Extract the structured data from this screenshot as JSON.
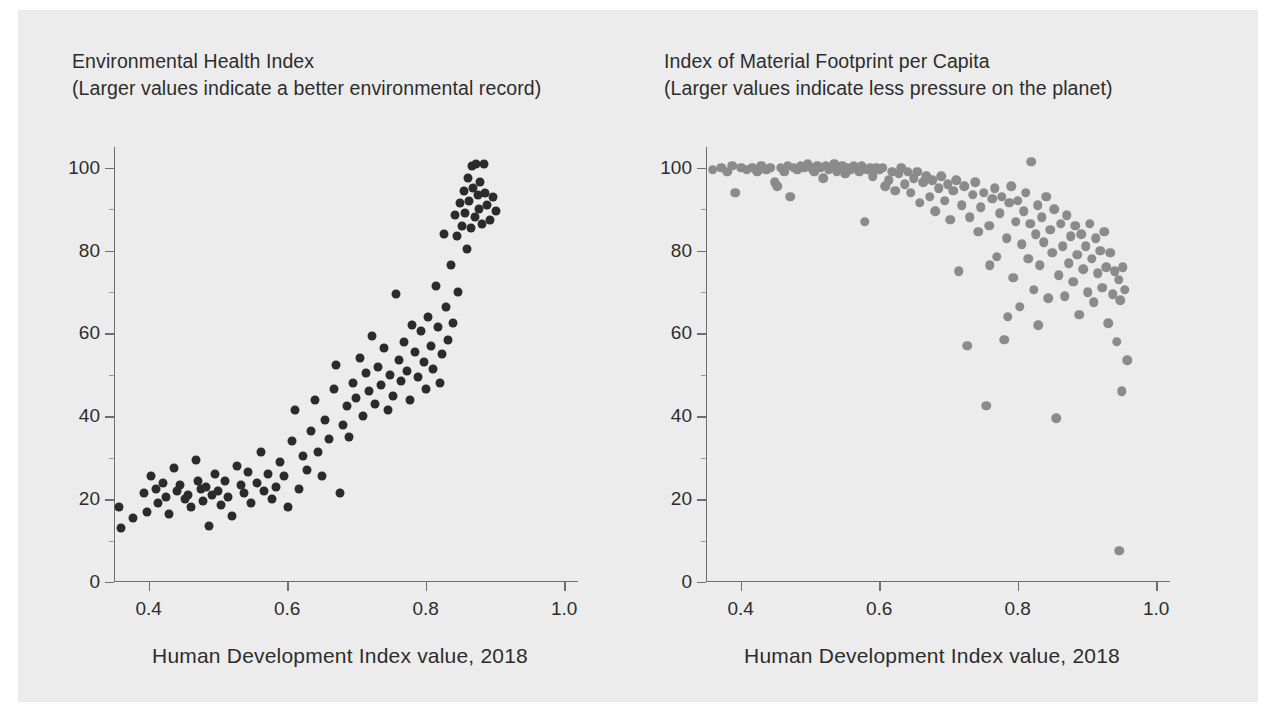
{
  "figure": {
    "background": "#ececec",
    "page_background": "#ffffff"
  },
  "panels": {
    "left": {
      "title_line1": "Environmental Health Index",
      "title_line2": "(Larger values indicate a better environmental record)",
      "axis_caption": "Human Development Index value, 2018",
      "dot_color": "#2b2b2b"
    },
    "right": {
      "title_line1": "Index of Material Footprint per Capita",
      "title_line2": "(Larger values indicate less pressure on the planet)",
      "axis_caption": "Human Development Index value, 2018",
      "dot_color": "#8b8b8b"
    }
  },
  "chart_data": [
    {
      "type": "scatter",
      "title": "Environmental Health Index",
      "subtitle": "(Larger values indicate a better environmental record)",
      "xlabel": "Human Development Index value, 2018",
      "ylabel": "Environmental Health Index",
      "xlim": [
        0.35,
        1.02
      ],
      "ylim": [
        0,
        105
      ],
      "xticks": [
        0.4,
        0.6,
        0.8,
        1.0
      ],
      "xtick_labels": [
        "0.4",
        "0.6",
        "0.8",
        "1.0"
      ],
      "yticks": [
        0,
        20,
        40,
        60,
        80,
        100
      ],
      "ytick_labels": [
        "0",
        "20",
        "40",
        "60",
        "80",
        "100"
      ],
      "grid": false,
      "legend": false,
      "marker_color": "#2b2b2b",
      "points": [
        [
          0.357,
          18.0
        ],
        [
          0.36,
          13.0
        ],
        [
          0.378,
          15.5
        ],
        [
          0.394,
          21.5
        ],
        [
          0.397,
          17.0
        ],
        [
          0.404,
          25.5
        ],
        [
          0.41,
          22.5
        ],
        [
          0.414,
          19.0
        ],
        [
          0.421,
          24.0
        ],
        [
          0.425,
          20.5
        ],
        [
          0.43,
          16.5
        ],
        [
          0.437,
          27.5
        ],
        [
          0.441,
          22.0
        ],
        [
          0.446,
          23.5
        ],
        [
          0.452,
          20.0
        ],
        [
          0.457,
          21.0
        ],
        [
          0.461,
          18.0
        ],
        [
          0.468,
          29.5
        ],
        [
          0.472,
          24.5
        ],
        [
          0.476,
          22.5
        ],
        [
          0.479,
          19.5
        ],
        [
          0.483,
          23.0
        ],
        [
          0.487,
          13.5
        ],
        [
          0.492,
          21.0
        ],
        [
          0.496,
          26.0
        ],
        [
          0.5,
          22.0
        ],
        [
          0.505,
          18.5
        ],
        [
          0.511,
          24.5
        ],
        [
          0.515,
          20.5
        ],
        [
          0.52,
          16.0
        ],
        [
          0.527,
          28.0
        ],
        [
          0.533,
          23.5
        ],
        [
          0.538,
          21.5
        ],
        [
          0.543,
          26.5
        ],
        [
          0.548,
          19.0
        ],
        [
          0.556,
          24.0
        ],
        [
          0.562,
          31.5
        ],
        [
          0.567,
          22.0
        ],
        [
          0.572,
          26.0
        ],
        [
          0.578,
          20.0
        ],
        [
          0.584,
          23.0
        ],
        [
          0.59,
          29.0
        ],
        [
          0.596,
          25.5
        ],
        [
          0.601,
          18.0
        ],
        [
          0.607,
          34.0
        ],
        [
          0.612,
          41.5
        ],
        [
          0.617,
          22.5
        ],
        [
          0.623,
          30.5
        ],
        [
          0.628,
          27.0
        ],
        [
          0.634,
          36.5
        ],
        [
          0.64,
          44.0
        ],
        [
          0.645,
          31.5
        ],
        [
          0.65,
          25.5
        ],
        [
          0.655,
          39.0
        ],
        [
          0.661,
          34.5
        ],
        [
          0.667,
          46.5
        ],
        [
          0.671,
          52.5
        ],
        [
          0.676,
          21.5
        ],
        [
          0.681,
          38.0
        ],
        [
          0.686,
          42.5
        ],
        [
          0.69,
          35.0
        ],
        [
          0.695,
          48.0
        ],
        [
          0.7,
          44.5
        ],
        [
          0.705,
          54.0
        ],
        [
          0.709,
          40.0
        ],
        [
          0.714,
          50.5
        ],
        [
          0.718,
          46.0
        ],
        [
          0.723,
          59.5
        ],
        [
          0.727,
          43.0
        ],
        [
          0.731,
          52.0
        ],
        [
          0.736,
          47.5
        ],
        [
          0.74,
          56.5
        ],
        [
          0.745,
          41.5
        ],
        [
          0.749,
          50.0
        ],
        [
          0.753,
          45.0
        ],
        [
          0.757,
          69.5
        ],
        [
          0.761,
          53.5
        ],
        [
          0.765,
          48.5
        ],
        [
          0.769,
          58.0
        ],
        [
          0.773,
          51.0
        ],
        [
          0.777,
          44.0
        ],
        [
          0.781,
          62.0
        ],
        [
          0.785,
          55.5
        ],
        [
          0.789,
          49.5
        ],
        [
          0.793,
          60.5
        ],
        [
          0.797,
          53.0
        ],
        [
          0.8,
          46.5
        ],
        [
          0.804,
          64.0
        ],
        [
          0.808,
          57.0
        ],
        [
          0.811,
          51.5
        ],
        [
          0.815,
          71.5
        ],
        [
          0.818,
          61.5
        ],
        [
          0.821,
          48.0
        ],
        [
          0.824,
          55.0
        ],
        [
          0.827,
          84.0
        ],
        [
          0.83,
          66.5
        ],
        [
          0.833,
          58.5
        ],
        [
          0.836,
          76.5
        ],
        [
          0.839,
          62.5
        ],
        [
          0.842,
          88.5
        ],
        [
          0.845,
          83.5
        ],
        [
          0.847,
          70.0
        ],
        [
          0.85,
          91.5
        ],
        [
          0.852,
          86.0
        ],
        [
          0.855,
          94.5
        ],
        [
          0.857,
          89.0
        ],
        [
          0.859,
          80.5
        ],
        [
          0.861,
          97.5
        ],
        [
          0.863,
          92.0
        ],
        [
          0.865,
          85.5
        ],
        [
          0.867,
          100.5
        ],
        [
          0.869,
          95.0
        ],
        [
          0.871,
          88.0
        ],
        [
          0.873,
          101.0
        ],
        [
          0.875,
          93.5
        ],
        [
          0.877,
          90.0
        ],
        [
          0.879,
          96.5
        ],
        [
          0.881,
          86.5
        ],
        [
          0.884,
          101.0
        ],
        [
          0.886,
          94.0
        ],
        [
          0.889,
          91.0
        ],
        [
          0.893,
          87.5
        ],
        [
          0.897,
          93.0
        ],
        [
          0.902,
          89.5
        ]
      ]
    },
    {
      "type": "scatter",
      "title": "Index of Material Footprint per Capita",
      "subtitle": "(Larger values indicate less pressure on the planet)",
      "xlabel": "Human Development Index value, 2018",
      "ylabel": "Index of Material Footprint per Capita",
      "xlim": [
        0.35,
        1.02
      ],
      "ylim": [
        0,
        105
      ],
      "xticks": [
        0.4,
        0.6,
        0.8,
        1.0
      ],
      "xtick_labels": [
        "0.4",
        "0.6",
        "0.8",
        "1.0"
      ],
      "yticks": [
        0,
        20,
        40,
        60,
        80,
        100
      ],
      "ytick_labels": [
        "0",
        "20",
        "40",
        "60",
        "80",
        "100"
      ],
      "grid": false,
      "legend": false,
      "marker_color": "#8b8b8b",
      "points": [
        [
          0.36,
          99.5
        ],
        [
          0.372,
          100.0
        ],
        [
          0.381,
          99.0
        ],
        [
          0.388,
          100.5
        ],
        [
          0.392,
          94.0
        ],
        [
          0.401,
          100.0
        ],
        [
          0.409,
          99.5
        ],
        [
          0.417,
          100.0
        ],
        [
          0.424,
          99.0
        ],
        [
          0.43,
          100.5
        ],
        [
          0.437,
          99.5
        ],
        [
          0.443,
          100.0
        ],
        [
          0.449,
          96.5
        ],
        [
          0.453,
          95.5
        ],
        [
          0.458,
          100.0
        ],
        [
          0.463,
          99.0
        ],
        [
          0.468,
          100.5
        ],
        [
          0.472,
          93.0
        ],
        [
          0.477,
          100.0
        ],
        [
          0.482,
          99.5
        ],
        [
          0.487,
          100.5
        ],
        [
          0.492,
          100.0
        ],
        [
          0.497,
          101.0
        ],
        [
          0.502,
          100.0
        ],
        [
          0.506,
          99.0
        ],
        [
          0.511,
          100.5
        ],
        [
          0.515,
          100.0
        ],
        [
          0.519,
          97.5
        ],
        [
          0.523,
          100.5
        ],
        [
          0.527,
          99.5
        ],
        [
          0.531,
          100.0
        ],
        [
          0.535,
          101.0
        ],
        [
          0.539,
          99.0
        ],
        [
          0.543,
          100.0
        ],
        [
          0.547,
          100.5
        ],
        [
          0.551,
          98.5
        ],
        [
          0.555,
          100.0
        ],
        [
          0.559,
          99.5
        ],
        [
          0.563,
          100.5
        ],
        [
          0.567,
          100.0
        ],
        [
          0.571,
          99.0
        ],
        [
          0.575,
          100.5
        ],
        [
          0.579,
          87.0
        ],
        [
          0.583,
          99.5
        ],
        [
          0.587,
          100.0
        ],
        [
          0.591,
          98.0
        ],
        [
          0.596,
          100.0
        ],
        [
          0.6,
          99.5
        ],
        [
          0.605,
          100.0
        ],
        [
          0.609,
          95.5
        ],
        [
          0.614,
          97.0
        ],
        [
          0.619,
          99.0
        ],
        [
          0.623,
          94.5
        ],
        [
          0.628,
          98.5
        ],
        [
          0.632,
          100.0
        ],
        [
          0.637,
          96.0
        ],
        [
          0.641,
          99.0
        ],
        [
          0.646,
          94.0
        ],
        [
          0.65,
          97.5
        ],
        [
          0.655,
          99.0
        ],
        [
          0.659,
          91.5
        ],
        [
          0.664,
          96.5
        ],
        [
          0.668,
          98.0
        ],
        [
          0.673,
          93.0
        ],
        [
          0.677,
          97.0
        ],
        [
          0.681,
          89.5
        ],
        [
          0.686,
          95.0
        ],
        [
          0.69,
          98.0
        ],
        [
          0.695,
          92.0
        ],
        [
          0.699,
          96.0
        ],
        [
          0.703,
          87.5
        ],
        [
          0.707,
          94.5
        ],
        [
          0.711,
          97.0
        ],
        [
          0.715,
          75.0
        ],
        [
          0.719,
          91.0
        ],
        [
          0.723,
          95.5
        ],
        [
          0.727,
          57.0
        ],
        [
          0.731,
          88.0
        ],
        [
          0.735,
          93.5
        ],
        [
          0.739,
          96.5
        ],
        [
          0.743,
          84.5
        ],
        [
          0.747,
          90.5
        ],
        [
          0.751,
          94.0
        ],
        [
          0.755,
          42.5
        ],
        [
          0.759,
          86.0
        ],
        [
          0.763,
          92.5
        ],
        [
          0.767,
          95.0
        ],
        [
          0.77,
          78.5
        ],
        [
          0.774,
          89.0
        ],
        [
          0.777,
          93.0
        ],
        [
          0.781,
          58.5
        ],
        [
          0.784,
          83.0
        ],
        [
          0.788,
          91.5
        ],
        [
          0.791,
          95.5
        ],
        [
          0.794,
          73.5
        ],
        [
          0.797,
          87.0
        ],
        [
          0.8,
          92.0
        ],
        [
          0.803,
          66.5
        ],
        [
          0.806,
          81.5
        ],
        [
          0.809,
          89.5
        ],
        [
          0.812,
          94.0
        ],
        [
          0.815,
          78.0
        ],
        [
          0.818,
          86.5
        ],
        [
          0.82,
          101.5
        ],
        [
          0.823,
          70.5
        ],
        [
          0.826,
          84.0
        ],
        [
          0.829,
          91.0
        ],
        [
          0.832,
          76.5
        ],
        [
          0.835,
          88.0
        ],
        [
          0.838,
          82.0
        ],
        [
          0.841,
          93.0
        ],
        [
          0.844,
          68.5
        ],
        [
          0.847,
          85.0
        ],
        [
          0.85,
          79.5
        ],
        [
          0.853,
          90.0
        ],
        [
          0.856,
          39.5
        ],
        [
          0.859,
          74.0
        ],
        [
          0.862,
          86.5
        ],
        [
          0.865,
          81.0
        ],
        [
          0.868,
          69.0
        ],
        [
          0.871,
          88.5
        ],
        [
          0.874,
          77.0
        ],
        [
          0.877,
          83.5
        ],
        [
          0.88,
          72.5
        ],
        [
          0.883,
          86.0
        ],
        [
          0.886,
          79.0
        ],
        [
          0.889,
          64.5
        ],
        [
          0.892,
          84.0
        ],
        [
          0.895,
          75.5
        ],
        [
          0.898,
          81.0
        ],
        [
          0.901,
          70.0
        ],
        [
          0.904,
          86.5
        ],
        [
          0.907,
          78.0
        ],
        [
          0.91,
          67.5
        ],
        [
          0.913,
          83.0
        ],
        [
          0.916,
          74.5
        ],
        [
          0.919,
          80.0
        ],
        [
          0.922,
          71.0
        ],
        [
          0.925,
          84.5
        ],
        [
          0.928,
          76.0
        ],
        [
          0.931,
          62.5
        ],
        [
          0.934,
          79.5
        ],
        [
          0.937,
          69.5
        ],
        [
          0.94,
          75.0
        ],
        [
          0.943,
          58.0
        ],
        [
          0.946,
          73.0
        ],
        [
          0.948,
          68.0
        ],
        [
          0.95,
          46.0
        ],
        [
          0.952,
          76.0
        ],
        [
          0.955,
          70.5
        ],
        [
          0.947,
          7.5
        ],
        [
          0.958,
          53.5
        ],
        [
          0.83,
          62.0
        ],
        [
          0.786,
          64.0
        ],
        [
          0.76,
          76.5
        ]
      ]
    }
  ]
}
